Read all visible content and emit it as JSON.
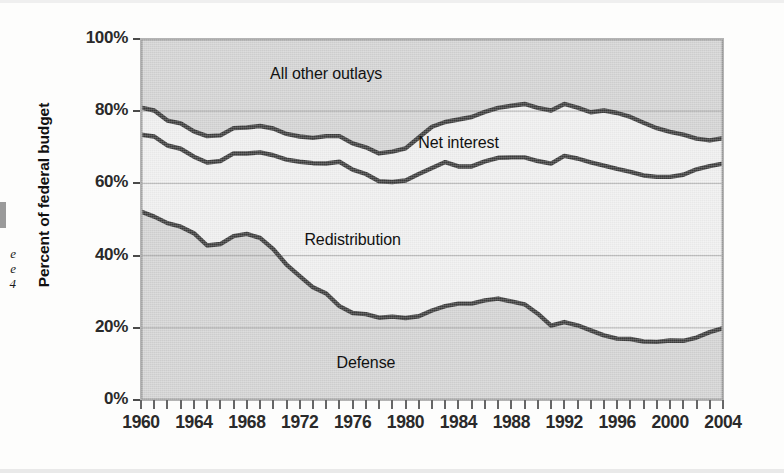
{
  "figure": {
    "margin_note_lines": [
      "e",
      "e",
      "4"
    ],
    "y_axis": {
      "title": "Percent of federal budget",
      "ticks": [
        "100%",
        "80%",
        "60%",
        "40%",
        "20%",
        "0%"
      ],
      "tick_values": [
        100,
        80,
        60,
        40,
        20,
        0
      ]
    },
    "x_axis": {
      "labels": [
        "1960",
        "1964",
        "1968",
        "1972",
        "1976",
        "1980",
        "1984",
        "1988",
        "1992",
        "1996",
        "2000",
        "2004"
      ],
      "label_values": [
        1960,
        1964,
        1968,
        1972,
        1976,
        1980,
        1984,
        1988,
        1992,
        1996,
        2000,
        2004
      ]
    },
    "colors": {
      "plot_background": "#d2d2d2",
      "band_light": "#f0f0f0",
      "line": "#3a3a3a",
      "gridline": "#8d8d8d",
      "text": "#2a2a2a",
      "page_background": "#fdfdfc"
    }
  },
  "chart_data": {
    "type": "area",
    "title": "",
    "subtitle": "",
    "xlabel": "",
    "ylabel": "Percent of federal budget",
    "xlim": [
      1960,
      2004
    ],
    "ylim": [
      0,
      100
    ],
    "grid": true,
    "stacked": true,
    "legend": "in-plot labels",
    "annotations": [
      {
        "text": "All other outlays",
        "x": 1974,
        "y": 90
      },
      {
        "text": "Net interest",
        "x": 1984,
        "y": 71
      },
      {
        "text": "Redistribution",
        "x": 1976,
        "y": 44
      },
      {
        "text": "Defense",
        "x": 1977,
        "y": 10
      }
    ],
    "x": [
      1960,
      1961,
      1962,
      1963,
      1964,
      1965,
      1966,
      1967,
      1968,
      1969,
      1970,
      1971,
      1972,
      1973,
      1974,
      1975,
      1976,
      1977,
      1978,
      1979,
      1980,
      1981,
      1982,
      1983,
      1984,
      1985,
      1986,
      1987,
      1988,
      1989,
      1990,
      1991,
      1992,
      1993,
      1994,
      1995,
      1996,
      1997,
      1998,
      1999,
      2000,
      2001,
      2002,
      2003,
      2004
    ],
    "series": [
      {
        "name": "Defense",
        "note": "bottom band; values are the share of the federal budget",
        "values": [
          52.2,
          50.8,
          49.0,
          48.0,
          46.2,
          42.8,
          43.2,
          45.4,
          46.0,
          44.9,
          41.8,
          37.5,
          34.3,
          31.2,
          29.5,
          26.0,
          24.1,
          23.8,
          22.8,
          23.1,
          22.7,
          23.2,
          24.8,
          26.0,
          26.7,
          26.7,
          27.6,
          28.1,
          27.3,
          26.5,
          23.9,
          20.6,
          21.6,
          20.7,
          19.3,
          17.9,
          17.0,
          16.9,
          16.2,
          16.1,
          16.5,
          16.4,
          17.3,
          18.8,
          19.9
        ]
      },
      {
        "name": "Redistribution",
        "note": "second band from bottom; cumulative top edge = Defense + Redistribution",
        "values": [
          21.3,
          22.2,
          21.5,
          21.6,
          21.2,
          23.0,
          23.0,
          22.9,
          22.3,
          23.7,
          26.0,
          29.1,
          31.7,
          34.4,
          36.0,
          40.0,
          39.7,
          38.8,
          37.8,
          37.3,
          38.1,
          39.4,
          39.5,
          39.9,
          38.0,
          38.0,
          38.5,
          39.0,
          39.9,
          40.7,
          42.3,
          44.9,
          46.0,
          46.2,
          46.5,
          47.0,
          47.0,
          46.3,
          46.0,
          45.7,
          45.3,
          46.0,
          46.6,
          46.0,
          45.6
        ]
      },
      {
        "name": "Net interest",
        "note": "third band; cumulative top edge = Defense + Redistribution + Net interest",
        "values": [
          7.5,
          7.2,
          6.9,
          7.0,
          7.0,
          7.3,
          7.1,
          7.0,
          7.2,
          7.3,
          7.4,
          7.1,
          7.0,
          7.0,
          7.6,
          7.1,
          7.3,
          7.4,
          7.7,
          8.4,
          8.9,
          10.1,
          11.4,
          11.1,
          13.0,
          13.7,
          13.7,
          13.8,
          14.3,
          14.8,
          14.7,
          14.7,
          14.4,
          14.1,
          13.9,
          15.3,
          15.5,
          15.2,
          14.6,
          13.5,
          12.5,
          11.1,
          8.5,
          7.1,
          7.0
        ]
      },
      {
        "name": "All other outlays",
        "note": "top band, fills remainder to 100%",
        "values": [
          19.0,
          19.8,
          22.6,
          23.4,
          25.6,
          26.9,
          26.7,
          24.7,
          24.5,
          24.1,
          24.8,
          26.3,
          27.0,
          27.4,
          26.9,
          26.9,
          28.9,
          30.0,
          31.7,
          31.2,
          30.3,
          27.3,
          24.3,
          23.0,
          22.3,
          21.6,
          20.2,
          19.1,
          18.5,
          18.0,
          19.1,
          19.8,
          18.0,
          19.0,
          20.3,
          19.8,
          20.5,
          21.6,
          23.2,
          24.7,
          25.7,
          26.5,
          27.6,
          28.1,
          27.5
        ]
      }
    ],
    "cumulative_boundaries": {
      "note": "y-values of the three drawn boundary lines, bottom to top",
      "defense_top": [
        52.2,
        50.8,
        49.0,
        48.0,
        46.2,
        42.8,
        43.2,
        45.4,
        46.0,
        44.9,
        41.8,
        37.5,
        34.3,
        31.2,
        29.5,
        26.0,
        24.1,
        23.8,
        22.8,
        23.1,
        22.7,
        23.2,
        24.8,
        26.0,
        26.7,
        26.7,
        27.6,
        28.1,
        27.3,
        26.5,
        23.9,
        20.6,
        21.6,
        20.7,
        19.3,
        17.9,
        17.0,
        16.9,
        16.2,
        16.1,
        16.5,
        16.4,
        17.3,
        18.8,
        19.9
      ],
      "redistribution_top": [
        73.5,
        73.0,
        70.5,
        69.6,
        67.4,
        65.8,
        66.2,
        68.3,
        68.3,
        68.6,
        67.8,
        66.6,
        66.0,
        65.6,
        65.5,
        66.0,
        63.8,
        62.6,
        60.6,
        60.4,
        60.8,
        62.6,
        64.3,
        65.9,
        64.7,
        64.7,
        66.1,
        67.1,
        67.2,
        67.2,
        66.2,
        65.5,
        67.6,
        66.9,
        65.8,
        64.9,
        64.0,
        63.2,
        62.2,
        61.8,
        61.8,
        62.4,
        63.9,
        64.8,
        65.5
      ],
      "net_interest_top": [
        81.0,
        80.2,
        77.4,
        76.6,
        74.4,
        73.1,
        73.3,
        75.3,
        75.5,
        75.9,
        75.2,
        73.7,
        73.0,
        72.6,
        73.1,
        73.1,
        71.1,
        70.0,
        68.3,
        68.8,
        69.7,
        72.7,
        75.7,
        77.0,
        77.7,
        78.4,
        79.8,
        80.9,
        81.5,
        82.0,
        80.9,
        80.2,
        82.0,
        81.0,
        79.7,
        80.2,
        79.5,
        78.4,
        76.8,
        75.3,
        74.3,
        73.5,
        72.4,
        71.9,
        72.5
      ]
    }
  }
}
